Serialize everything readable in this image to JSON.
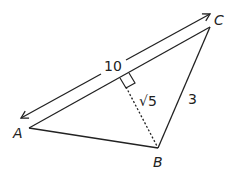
{
  "diagram": {
    "type": "triangle-with-altitude",
    "vertices": [
      {
        "name": "A",
        "label": "A"
      },
      {
        "name": "B",
        "label": "B"
      },
      {
        "name": "C",
        "label": "C"
      }
    ],
    "labels": {
      "ac_length": "10",
      "altitude": "√5",
      "bc_length": "3"
    },
    "colors": {
      "stroke": "#222222",
      "background": "#ffffff"
    }
  }
}
